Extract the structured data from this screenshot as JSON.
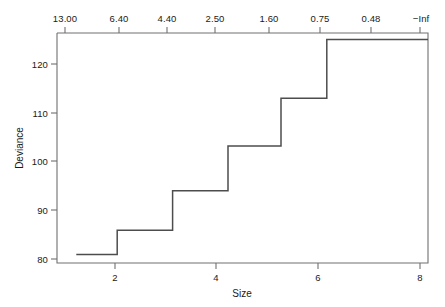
{
  "chart_data": {
    "type": "line",
    "variant": "step",
    "title": "",
    "xlabel": "Size",
    "ylabel": "Deviance",
    "xlim": [
      0.6,
      8.3
    ],
    "ylim": [
      78.5,
      127.8
    ],
    "grid": false,
    "legend": null,
    "x": [
      1,
      1.85,
      1.85,
      3.0,
      3.0,
      4.15,
      4.15,
      5.25,
      5.25,
      6.2,
      6.2,
      8.3
    ],
    "y": [
      80.3,
      80.3,
      85.5,
      85.5,
      94.0,
      94.0,
      103.6,
      103.6,
      113.8,
      113.8,
      126.4,
      126.4
    ],
    "steps": [
      {
        "size_from": 1.0,
        "size_to": 1.85,
        "deviance": 80.3
      },
      {
        "size_from": 1.85,
        "size_to": 3.0,
        "deviance": 85.5
      },
      {
        "size_from": 3.0,
        "size_to": 4.15,
        "deviance": 94.0
      },
      {
        "size_from": 4.15,
        "size_to": 5.25,
        "deviance": 103.6
      },
      {
        "size_from": 5.25,
        "size_to": 6.2,
        "deviance": 113.8
      },
      {
        "size_from": 6.2,
        "size_to": 8.3,
        "deviance": 126.4
      }
    ],
    "x_ticks": [
      {
        "value": 2,
        "label": "2"
      },
      {
        "value": 4,
        "label": "4"
      },
      {
        "value": 6,
        "label": "6"
      },
      {
        "value": 8,
        "label": "8"
      }
    ],
    "y_ticks": [
      {
        "value": 80,
        "label": "80"
      },
      {
        "value": 90,
        "label": "90"
      },
      {
        "value": 100,
        "label": "100"
      },
      {
        "value": 110,
        "label": "110"
      },
      {
        "value": 120,
        "label": "120"
      }
    ],
    "top_axis": {
      "label": "",
      "ticks": [
        {
          "px": 65,
          "label": "13.00"
        },
        {
          "px": 119,
          "label": "6.40"
        },
        {
          "px": 167,
          "label": "4.40"
        },
        {
          "px": 215,
          "label": "2.50"
        },
        {
          "px": 269,
          "label": "1.60"
        },
        {
          "px": 320,
          "label": "0.75"
        },
        {
          "px": 371,
          "label": "0.48"
        },
        {
          "px": 420,
          "label": "−Inf"
        }
      ]
    },
    "line_color": "#4d4d4d",
    "axis_color": "#707070",
    "background": "#ffffff"
  }
}
